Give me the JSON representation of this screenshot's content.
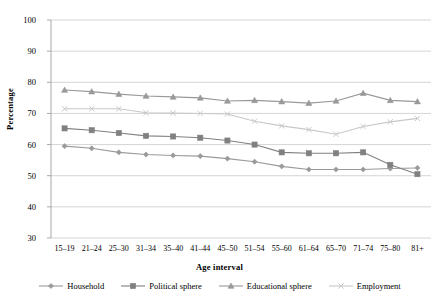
{
  "chart_data": {
    "type": "line",
    "title": "",
    "xlabel": "Age interval",
    "ylabel": "Percentage",
    "ylim": [
      30,
      100
    ],
    "ytick_step": 10,
    "yticks": [
      100,
      90,
      80,
      70,
      60,
      50,
      40,
      30
    ],
    "grid": true,
    "grid_axis": "y",
    "legend_position": "bottom",
    "categories": [
      "15–19",
      "21–24",
      "25–30",
      "31–34",
      "35–40",
      "41–44",
      "45–50",
      "51–54",
      "55–60",
      "61–64",
      "65–70",
      "71–74",
      "75–80",
      "81+"
    ],
    "series": [
      {
        "name": "Household",
        "marker": "diamond",
        "color": "#9a9a9a",
        "values": [
          59.5,
          58.8,
          57.5,
          56.8,
          56.5,
          56.3,
          55.5,
          54.5,
          53.0,
          52.0,
          52.0,
          52.0,
          52.3,
          52.5
        ]
      },
      {
        "name": "Political sphere",
        "marker": "square",
        "color": "#808080",
        "values": [
          65.2,
          64.6,
          63.7,
          62.8,
          62.6,
          62.2,
          61.3,
          60.0,
          57.5,
          57.2,
          57.2,
          57.5,
          53.5,
          50.5
        ]
      },
      {
        "name": "Educational sphere",
        "marker": "triangle",
        "color": "#999999",
        "values": [
          77.5,
          77.0,
          76.2,
          75.6,
          75.3,
          75.0,
          74.0,
          74.2,
          73.8,
          73.3,
          74.0,
          76.5,
          74.2,
          73.8
        ]
      },
      {
        "name": "Employment",
        "marker": "x",
        "color": "#c8c8c8",
        "values": [
          71.5,
          71.5,
          71.5,
          70.2,
          70.1,
          70.0,
          69.8,
          67.5,
          66.0,
          64.8,
          63.3,
          65.8,
          67.3,
          68.4
        ]
      }
    ]
  },
  "axis": {
    "ylabel": "Percentage",
    "xlabel": "Age interval"
  },
  "legend": {
    "items": [
      {
        "label": "Household"
      },
      {
        "label": "Political sphere"
      },
      {
        "label": "Educational sphere"
      },
      {
        "label": "Employment"
      }
    ]
  }
}
